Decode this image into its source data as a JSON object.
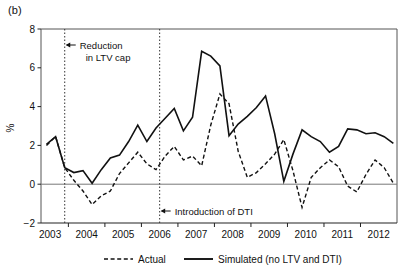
{
  "figure": {
    "panel_label": "(b)"
  },
  "chart_data": {
    "type": "line",
    "title": "",
    "subtitle": "",
    "xlabel": "",
    "ylabel": "%",
    "xlim": [
      2002.75,
      2012.5
    ],
    "ylim": [
      -2,
      8
    ],
    "yticks": [
      -2,
      0,
      2,
      4,
      6,
      8
    ],
    "ytick_labels": [
      "−2",
      "0",
      "2",
      "4",
      "6",
      "8"
    ],
    "xticks": [
      2003,
      2004,
      2005,
      2006,
      2007,
      2008,
      2009,
      2010,
      2011,
      2012
    ],
    "xtick_labels": [
      "2003",
      "2004",
      "2005",
      "2006",
      "2007",
      "2008",
      "2009",
      "2010",
      "2011",
      "2012"
    ],
    "grid": false,
    "zero_line": 0,
    "legend_position": "bottom",
    "x": [
      2002.9,
      2003.15,
      2003.4,
      2003.65,
      2003.9,
      2004.15,
      2004.4,
      2004.65,
      2004.9,
      2005.15,
      2005.4,
      2005.65,
      2005.9,
      2006.15,
      2006.4,
      2006.65,
      2006.9,
      2007.15,
      2007.4,
      2007.65,
      2007.9,
      2008.15,
      2008.4,
      2008.65,
      2008.9,
      2009.15,
      2009.4,
      2009.65,
      2009.9,
      2010.15,
      2010.4,
      2010.65,
      2010.9,
      2011.15,
      2011.4,
      2011.65,
      2011.9,
      2012.15,
      2012.4
    ],
    "series": [
      {
        "name": "Actual",
        "style": "dashed",
        "color": "#111111",
        "values": [
          2.0,
          2.45,
          0.85,
          0.2,
          -0.35,
          -1.05,
          -0.6,
          -0.35,
          0.55,
          1.1,
          1.65,
          1.05,
          0.75,
          1.45,
          1.95,
          1.25,
          1.45,
          0.95,
          3.05,
          4.65,
          4.15,
          1.7,
          0.35,
          0.6,
          1.05,
          1.55,
          2.3,
          0.7,
          -1.2,
          0.35,
          0.85,
          1.25,
          0.9,
          -0.1,
          -0.4,
          0.5,
          1.25,
          0.85,
          0.05
        ],
        "description": "Actual mortgage credit growth with LTV and DTI regulation in place"
      },
      {
        "name": "Simulated (no LTV and DTI)",
        "style": "solid",
        "color": "#111111",
        "values": [
          2.05,
          2.45,
          0.85,
          0.6,
          0.7,
          0.05,
          0.75,
          1.35,
          1.5,
          2.2,
          3.05,
          2.2,
          2.9,
          3.4,
          3.9,
          2.75,
          3.45,
          6.85,
          6.6,
          6.1,
          2.5,
          3.1,
          3.5,
          3.95,
          4.55,
          2.6,
          0.15,
          1.55,
          2.8,
          2.45,
          2.2,
          1.65,
          1.95,
          2.85,
          2.8,
          2.6,
          2.65,
          2.45,
          2.1
        ],
        "description": "Counterfactual simulation assuming no LTV cap and no DTI limit"
      }
    ],
    "annotations": [
      {
        "id": "ltv-cap",
        "label": "Reduction\nin LTV cap",
        "label_line1": "Reduction",
        "label_line2": "in LTV cap",
        "x": 2003.4,
        "vline": true,
        "vline_style": "dotted",
        "arrow": "left"
      },
      {
        "id": "dti-intro",
        "label": "Introduction of DTI",
        "label_line1": "Introduction of DTI",
        "label_line2": "",
        "x": 2006.0,
        "vline": true,
        "vline_style": "dotted",
        "arrow": "left"
      }
    ],
    "legend": [
      {
        "label": "Actual",
        "style": "dashed"
      },
      {
        "label": "Simulated (no LTV and DTI)",
        "style": "solid"
      }
    ]
  }
}
